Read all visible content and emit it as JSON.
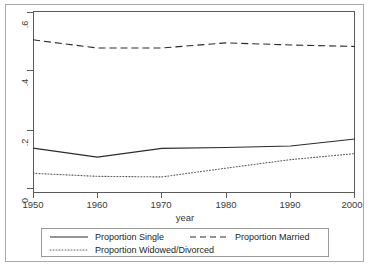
{
  "page": {
    "clipped_header_text": "",
    "background": "#ffffff",
    "frame_color": "#aaaaaa"
  },
  "chart_data": {
    "type": "line",
    "title": "",
    "xlabel": "year",
    "ylabel": "",
    "x": [
      1950,
      1960,
      1970,
      1980,
      1990,
      2000
    ],
    "xlim": [
      1950,
      2000
    ],
    "ylim": [
      0,
      0.6
    ],
    "xticks": [
      1950,
      1960,
      1970,
      1980,
      1990,
      2000
    ],
    "xtick_labels": [
      "1950",
      "1960",
      "1970",
      "1980",
      "1990",
      "2000"
    ],
    "yticks": [
      0,
      0.2,
      0.4,
      0.6
    ],
    "ytick_labels": [
      "0",
      ".2",
      ".4",
      ".6"
    ],
    "grid": false,
    "legend_position": "below-axes",
    "line_color": "#2b2b2b",
    "series": [
      {
        "name": "Proportion Single",
        "style": "solid",
        "values": [
          0.148,
          0.118,
          0.147,
          0.15,
          0.155,
          0.178
        ]
      },
      {
        "name": "Proportion Married",
        "style": "dashed",
        "values": [
          0.505,
          0.478,
          0.478,
          0.495,
          0.488,
          0.483
        ]
      },
      {
        "name": "Proportion Widowed/Divorced",
        "style": "dotted",
        "values": [
          0.065,
          0.055,
          0.053,
          0.082,
          0.11,
          0.13
        ]
      }
    ]
  },
  "legend": {
    "items": [
      {
        "label": "Proportion Single",
        "style": "solid"
      },
      {
        "label": "Proportion Married",
        "style": "dashed"
      },
      {
        "label": "Proportion Widowed/Divorced",
        "style": "dotted"
      }
    ]
  }
}
